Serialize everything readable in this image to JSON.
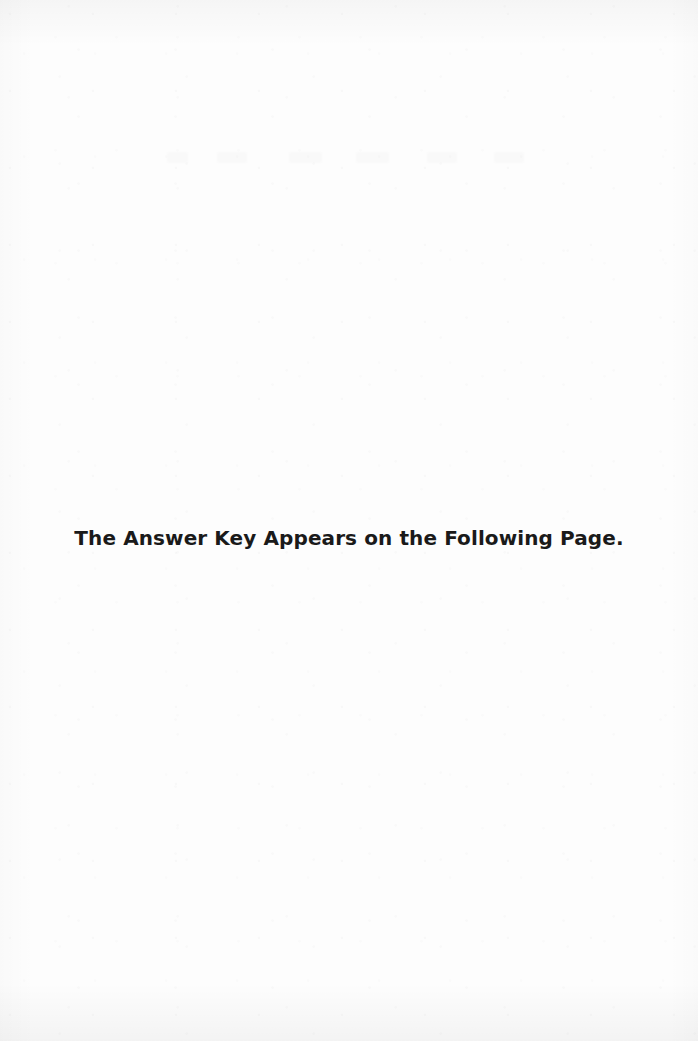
{
  "page": {
    "width": 698,
    "height": 1041,
    "background_color": "#fdfdfd",
    "text_color": "#1a1a1a",
    "kind": "scanned-book-page"
  },
  "body": {
    "notice": "The Answer Key Appears on the Following Page."
  }
}
